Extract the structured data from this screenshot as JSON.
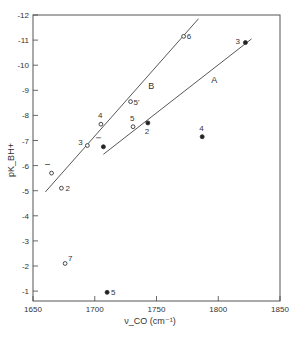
{
  "chart_data": {
    "type": "scatter",
    "title": "",
    "xlabel": "ν_CO (cm⁻¹)",
    "ylabel": "pK_BH+",
    "xlim": [
      1650,
      1850
    ],
    "ylim": [
      -0.6,
      -12
    ],
    "y_inverted": true,
    "grid": false,
    "x_ticks": [
      1650,
      1700,
      1750,
      1800,
      1850
    ],
    "x_tick_labels": [
      "1650",
      "1700",
      "1750",
      "1800",
      "1850"
    ],
    "y_ticks": [
      -1,
      -2,
      -3,
      -4,
      -5,
      -6,
      -7,
      -8,
      -9,
      -10,
      -11,
      -12
    ],
    "y_tick_labels": [
      "-1",
      "-2",
      "-3",
      "-4",
      "-5",
      "-6",
      "-7",
      "-8",
      "-9",
      "-10",
      "-11",
      "-12"
    ],
    "series": [
      {
        "name": "open circles",
        "marker": "open-circle",
        "points": [
          {
            "label": "1",
            "x": 1665,
            "y": -5.7
          },
          {
            "label": "2",
            "x": 1673,
            "y": -5.1
          },
          {
            "label": "3",
            "x": 1694,
            "y": -6.8
          },
          {
            "label": "4",
            "x": 1705,
            "y": -7.65
          },
          {
            "label": "5'",
            "x": 1729,
            "y": -8.55
          },
          {
            "label": "5",
            "x": 1731,
            "y": -7.55
          },
          {
            "label": "6",
            "x": 1772,
            "y": -11.15
          },
          {
            "label": "7",
            "x": 1676,
            "y": -2.1
          }
        ]
      },
      {
        "name": "filled circles",
        "marker": "filled-circle",
        "points": [
          {
            "label": "1",
            "x": 1707,
            "y": -6.75
          },
          {
            "label": "2",
            "x": 1743,
            "y": -7.7
          },
          {
            "label": "3",
            "x": 1822,
            "y": -10.9
          },
          {
            "label": "4",
            "x": 1787,
            "y": -7.15
          },
          {
            "label": "5",
            "x": 1710,
            "y": -0.95
          }
        ]
      }
    ],
    "lines": [
      {
        "name": "B",
        "from": {
          "x": 1660,
          "y": -4.95
        },
        "to": {
          "x": 1784,
          "y": -11.85
        }
      },
      {
        "name": "A",
        "from": {
          "x": 1707,
          "y": -6.45
        },
        "to": {
          "x": 1827,
          "y": -11.05
        }
      }
    ],
    "annotations": [
      "A",
      "B"
    ]
  },
  "caption": "Fig. — Correlation of pK_BH+ with ν_CO"
}
